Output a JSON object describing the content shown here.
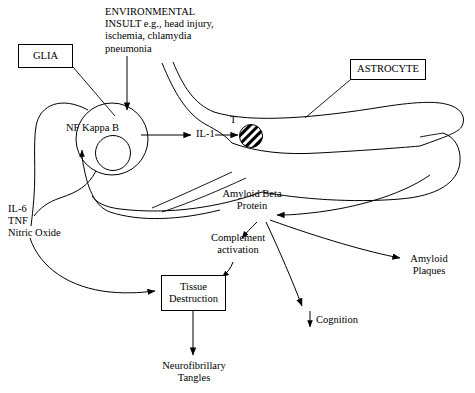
{
  "diagram": {
    "line_color": "#000000",
    "background_color": "#ffffff",
    "labels": {
      "glia_box": "GLIA",
      "astrocyte_box": "ASTROCYTE",
      "environmental_insult": "ENVIRONMENTAL\nINSULT e.g., head injury,\nischemia, chlamydia\npneumonia",
      "nf_kappa_b": "NF Kappa B",
      "il_1": "IL-1",
      "receptor_t": "T",
      "cytokines": "IL-6\nTNF\nNitric Oxide",
      "amyloid_beta_protein": "Amyloid Beta\nProtein",
      "complement_activation": "Complement\nactivation",
      "tissue_destruction": "Tissue\nDestruction",
      "neurofibrillary_tangles": "Neurofibrillary\nTangles",
      "amyloid_plaques": "Amyloid\nPlaques",
      "cognition": "Cognition",
      "cognition_arrow_glyph": "↓"
    },
    "nodes": [
      {
        "id": "glia-box",
        "label": "GLIA",
        "shape": "rectangle"
      },
      {
        "id": "astrocyte-box",
        "label": "ASTROCYTE",
        "shape": "rectangle"
      },
      {
        "id": "tissue-destruction-box",
        "label": "Tissue Destruction",
        "shape": "rectangle"
      },
      {
        "id": "glia-cell",
        "label": "NF Kappa B",
        "shape": "circle-with-nucleus"
      },
      {
        "id": "astrocyte-cell",
        "label": "ASTROCYTE",
        "shape": "irregular-cell-outline"
      },
      {
        "id": "astrocyte-nucleus",
        "label": "",
        "shape": "hatched-circle"
      }
    ],
    "edges": [
      {
        "from": "environmental-insult",
        "to": "nf-kappa-b",
        "style": "straight-arrow"
      },
      {
        "from": "nf-kappa-b",
        "to": "il-1",
        "style": "straight-arrow"
      },
      {
        "from": "il-1",
        "to": "astrocyte-receptor-t",
        "style": "straight-arrow"
      },
      {
        "from": "amyloid-beta-protein",
        "to": "glia-cell",
        "style": "curved-arrow"
      },
      {
        "from": "amyloid-beta-protein",
        "to": "complement-activation",
        "style": "curved-arrow"
      },
      {
        "from": "amyloid-beta-protein",
        "to": "cognition",
        "style": "curved-arrow"
      },
      {
        "from": "amyloid-beta-protein",
        "to": "amyloid-plaques",
        "style": "curved-arrow"
      },
      {
        "from": "astrocyte-cell",
        "to": "amyloid-beta-protein",
        "style": "curved-arrow"
      },
      {
        "from": "complement-activation",
        "to": "tissue-destruction",
        "style": "curved-arrow"
      },
      {
        "from": "cytokines",
        "to": "tissue-destruction",
        "style": "curved-arrow"
      },
      {
        "from": "tissue-destruction",
        "to": "neurofibrillary-tangles",
        "style": "straight-arrow"
      },
      {
        "from": "glia-box",
        "to": "glia-cell",
        "style": "leader-line"
      },
      {
        "from": "astrocyte-box",
        "to": "astrocyte-cell",
        "style": "leader-line"
      }
    ]
  }
}
